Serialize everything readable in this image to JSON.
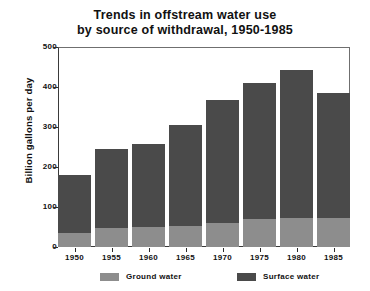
{
  "chart_data": {
    "type": "bar",
    "title": "Trends in offstream water use by source of withdrawal, 1950-1985",
    "title_line1": "Trends in offstream water use",
    "title_line2": "by source of withdrawal, 1950-1985",
    "xlabel": "",
    "ylabel": "Billion gallons per day",
    "ylim": [
      0,
      500
    ],
    "yticks": [
      0,
      100,
      200,
      300,
      400,
      500
    ],
    "ytick_labels": [
      "0",
      "100",
      "200",
      "300",
      "400",
      "500"
    ],
    "categories": [
      "1950",
      "1955",
      "1960",
      "1965",
      "1970",
      "1975",
      "1980",
      "1985"
    ],
    "stacked": true,
    "grid": false,
    "legend_position": "bottom",
    "series": [
      {
        "name": "Ground water",
        "color": "#8d8d8d",
        "values": [
          34,
          47,
          50,
          53,
          60,
          70,
          73,
          73
        ]
      },
      {
        "name": "Surface water",
        "color": "#4a4a4a",
        "values": [
          146,
          198,
          208,
          252,
          308,
          340,
          370,
          312
        ]
      }
    ],
    "totals": [
      180,
      245,
      258,
      305,
      368,
      410,
      443,
      385
    ]
  },
  "legend": {
    "items": [
      {
        "label": "Ground water",
        "color": "#8d8d8d"
      },
      {
        "label": "Surface water",
        "color": "#4a4a4a"
      }
    ]
  }
}
